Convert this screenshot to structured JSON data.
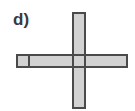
{
  "label": "d)",
  "colors": {
    "fill": "#d2d2d2",
    "stroke": "#4a4a4a",
    "text": "#3a3a3a"
  },
  "shape": {
    "description": "Cross-shaped net of unit squares: vertical strip crossing horizontal strip, with small end square on left",
    "vertical_bar": {
      "x": 72,
      "y": 12,
      "w": 14,
      "h": 97
    },
    "horizontal_bar": {
      "x": 16,
      "y": 54,
      "w": 112,
      "h": 14
    },
    "left_square": {
      "x": 16,
      "y": 54,
      "w": 14,
      "h": 14
    }
  }
}
